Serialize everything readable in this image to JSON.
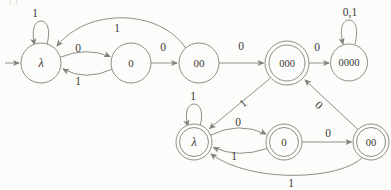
{
  "figure": {
    "corner_mark": "( )"
  },
  "automaton": {
    "states": [
      {
        "id": "top-lambda",
        "label": "λ",
        "row": "top",
        "accepting": false,
        "initial": true
      },
      {
        "id": "top-0",
        "label": "0",
        "row": "top",
        "accepting": false,
        "initial": false
      },
      {
        "id": "top-00",
        "label": "00",
        "row": "top",
        "accepting": false,
        "initial": false
      },
      {
        "id": "top-000",
        "label": "000",
        "row": "top",
        "accepting": true,
        "initial": false
      },
      {
        "id": "top-0000",
        "label": "0000",
        "row": "top",
        "accepting": false,
        "initial": false
      },
      {
        "id": "bottom-lambda",
        "label": "λ",
        "row": "bottom",
        "accepting": true,
        "initial": false
      },
      {
        "id": "bottom-0",
        "label": "0",
        "row": "bottom",
        "accepting": true,
        "initial": false
      },
      {
        "id": "bottom-00",
        "label": "00",
        "row": "bottom",
        "accepting": true,
        "initial": false
      }
    ],
    "edges": [
      {
        "from": "top-lambda",
        "to": "top-lambda",
        "symbol": "1"
      },
      {
        "from": "top-lambda",
        "to": "top-0",
        "symbol": "0"
      },
      {
        "from": "top-0",
        "to": "top-lambda",
        "symbol": "1"
      },
      {
        "from": "top-0",
        "to": "top-00",
        "symbol": "0"
      },
      {
        "from": "top-00",
        "to": "top-lambda",
        "symbol": "1"
      },
      {
        "from": "top-00",
        "to": "top-000",
        "symbol": "0"
      },
      {
        "from": "top-000",
        "to": "top-0000",
        "symbol": "0"
      },
      {
        "from": "top-0000",
        "to": "top-0000",
        "symbol": "0,1"
      },
      {
        "from": "top-000",
        "to": "bottom-lambda",
        "symbol": "1"
      },
      {
        "from": "bottom-lambda",
        "to": "bottom-lambda",
        "symbol": "1"
      },
      {
        "from": "bottom-lambda",
        "to": "bottom-0",
        "symbol": "0"
      },
      {
        "from": "bottom-0",
        "to": "bottom-lambda",
        "symbol": "1"
      },
      {
        "from": "bottom-0",
        "to": "bottom-00",
        "symbol": "0"
      },
      {
        "from": "bottom-00",
        "to": "top-000",
        "symbol": "0"
      },
      {
        "from": "bottom-00",
        "to": "bottom-lambda",
        "symbol": "1"
      }
    ],
    "colors": {
      "stroke": "#8f8d86",
      "text": "#3b3a35",
      "background": "#fcfcfa"
    }
  }
}
